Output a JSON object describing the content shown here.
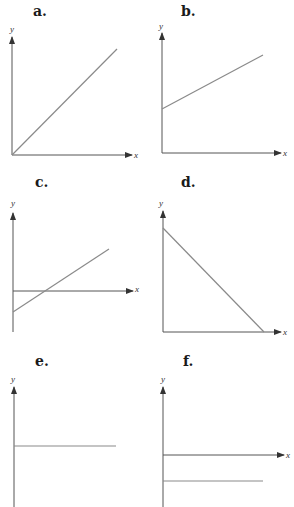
{
  "panels": [
    {
      "label": "a.",
      "xlabel": "x",
      "ylabel": "y",
      "description": "line through origin, positive slope"
    },
    {
      "label": "b.",
      "xlabel": "x",
      "ylabel": "y",
      "description": "line with positive y-intercept, positive slope"
    },
    {
      "label": "c.",
      "xlabel": "x",
      "ylabel": "y",
      "description": "line with negative y-intercept, positive slope crossing x-axis"
    },
    {
      "label": "d.",
      "xlabel": "x",
      "ylabel": "y",
      "description": "line with positive y-intercept, negative slope reaching x-axis"
    },
    {
      "label": "e.",
      "xlabel": "",
      "ylabel": "y",
      "description": "horizontal line, positive constant"
    },
    {
      "label": "f.",
      "xlabel": "x",
      "ylabel": "y",
      "description": "horizontal line, negative constant"
    }
  ],
  "colors": {
    "axis": "#555555",
    "line": "#8a8a8a",
    "text": "#1a1a1a"
  }
}
